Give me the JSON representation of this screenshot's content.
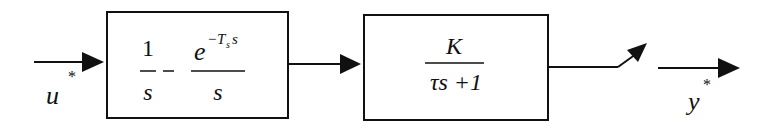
{
  "diagram": {
    "type": "block-diagram",
    "input": {
      "label": "u",
      "superscript": "*"
    },
    "blocks": [
      {
        "id": "zoh",
        "term1": {
          "numerator": "1",
          "denominator": "s"
        },
        "operator": "–",
        "term2": {
          "numerator_base": "e",
          "numerator_exp_minus": "−",
          "numerator_exp_T": "T",
          "numerator_exp_sub": "s",
          "numerator_exp_var": "s",
          "denominator": "s"
        }
      },
      {
        "id": "plant",
        "numerator": "K",
        "denominator": "τs +1"
      }
    ],
    "sampler": {
      "type": "switch"
    },
    "output": {
      "label": "y",
      "superscript": "*"
    },
    "colors": {
      "stroke": "#111111",
      "background": "#ffffff"
    }
  }
}
